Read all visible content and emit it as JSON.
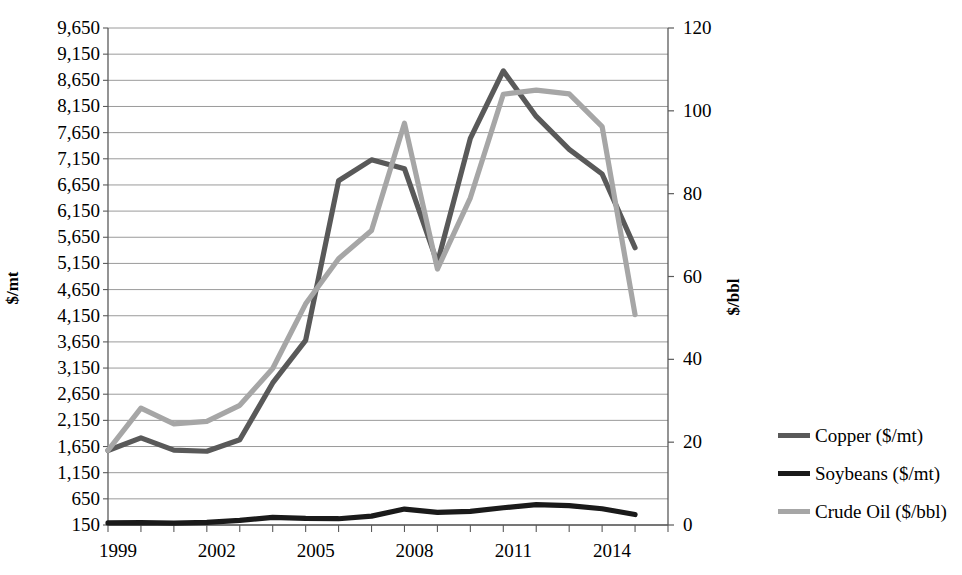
{
  "chart_data": {
    "type": "line",
    "title": "",
    "subtitle": "",
    "xlabel": "",
    "ylabel": "$/mt",
    "ylabel_secondary": "$/bbl",
    "grid": true,
    "legend_position": "right",
    "x": [
      1999,
      2000,
      2001,
      2002,
      2003,
      2004,
      2005,
      2006,
      2007,
      2008,
      2009,
      2010,
      2011,
      2012,
      2013,
      2014,
      2015
    ],
    "xlim": [
      1999,
      2016
    ],
    "xtick_labels": [
      "1999",
      "2002",
      "2005",
      "2008",
      "2011",
      "2014"
    ],
    "xtick_values": [
      1999,
      2002,
      2005,
      2008,
      2011,
      2014
    ],
    "ylim": [
      150,
      9650
    ],
    "ytick_labels": [
      "9,650",
      "9,150",
      "8,650",
      "8,150",
      "7,650",
      "7,150",
      "6,650",
      "6,150",
      "5,650",
      "5,150",
      "4,650",
      "4,150",
      "3,650",
      "3,150",
      "2,650",
      "2,150",
      "1,650",
      "1,150",
      "650",
      "150"
    ],
    "ytick_values": [
      9650,
      9150,
      8650,
      8150,
      7650,
      7150,
      6650,
      6150,
      5650,
      5150,
      4650,
      4150,
      3650,
      3150,
      2650,
      2150,
      1650,
      1150,
      650,
      150
    ],
    "ylim_secondary": [
      0,
      120
    ],
    "ytick_labels_secondary": [
      "120",
      "100",
      "80",
      "60",
      "40",
      "20",
      "0"
    ],
    "ytick_values_secondary": [
      120,
      100,
      80,
      60,
      40,
      20,
      0
    ],
    "series": [
      {
        "name": "Copper ($/mt)",
        "axis": "left",
        "color": "#595959",
        "values": [
          1575,
          1815,
          1580,
          1560,
          1780,
          2865,
          3680,
          6730,
          7130,
          6960,
          5160,
          7540,
          8830,
          7960,
          7330,
          6860,
          5450
        ]
      },
      {
        "name": "Soybeans ($/mt)",
        "axis": "left",
        "color": "#1a1a1a",
        "values": [
          190,
          195,
          185,
          200,
          240,
          295,
          275,
          270,
          320,
          455,
          390,
          410,
          480,
          540,
          520,
          460,
          350
        ]
      },
      {
        "name": "Crude Oil ($/bbl)",
        "axis": "right",
        "color": "#a6a6a6",
        "values": [
          18.0,
          28.2,
          24.4,
          25.0,
          28.9,
          37.8,
          53.4,
          64.3,
          71.1,
          97.0,
          61.8,
          79.0,
          104.0,
          105.0,
          104.1,
          96.2,
          50.8
        ]
      }
    ]
  },
  "legend": {
    "items": [
      {
        "label": "Copper ($/mt)",
        "color": "#595959"
      },
      {
        "label": "Soybeans ($/mt)",
        "color": "#1a1a1a"
      },
      {
        "label": "Crude Oil ($/bbl)",
        "color": "#a6a6a6"
      }
    ]
  },
  "colors": {
    "axis": "#5a5a5a",
    "gridline": "#8f8f8f",
    "background": "#ffffff"
  }
}
